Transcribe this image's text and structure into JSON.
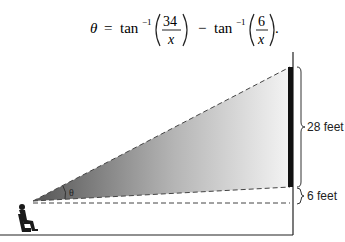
{
  "formula": {
    "lhs": "θ",
    "eq": "=",
    "term1_fn": "tan",
    "term1_sup": "−1",
    "term1_num": "34",
    "term1_den": "x",
    "minus": "−",
    "term2_fn": "tan",
    "term2_sup": "−1",
    "term2_num": "6",
    "term2_den": "x",
    "end": "."
  },
  "diagram": {
    "angle_label": "θ",
    "screen_height_label": "28 feet",
    "screen_offset_label": "6 feet",
    "colors": {
      "screen": "#111111",
      "gradient_dark": "#555555",
      "gradient_light": "#f4f4f4",
      "lines": "#333333"
    }
  }
}
